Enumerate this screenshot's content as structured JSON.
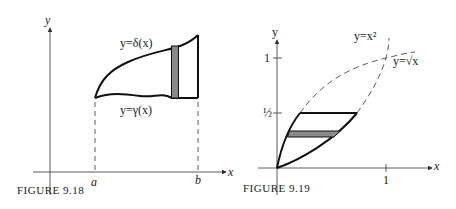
{
  "figures": [
    {
      "caption": "FIGURE 9.18",
      "axes": {
        "x_label": "x",
        "y_label": "y"
      },
      "ticks": {
        "a": "a",
        "b": "b"
      },
      "curves": {
        "upper": "y=δ(x)",
        "lower": "y=γ(x)"
      },
      "shaded": "vertical strip"
    },
    {
      "caption": "FIGURE 9.19",
      "axes": {
        "x_label": "x",
        "y_label": "y"
      },
      "ticks": {
        "x_one": "1",
        "y_one": "1",
        "y_half": "½"
      },
      "curves": {
        "parabola": "y=x²",
        "sqrt": "y=√x"
      },
      "shaded": "horizontal strip"
    }
  ],
  "colors": {
    "ink": "#1a1a1a",
    "shade": "#8a8a8a"
  }
}
